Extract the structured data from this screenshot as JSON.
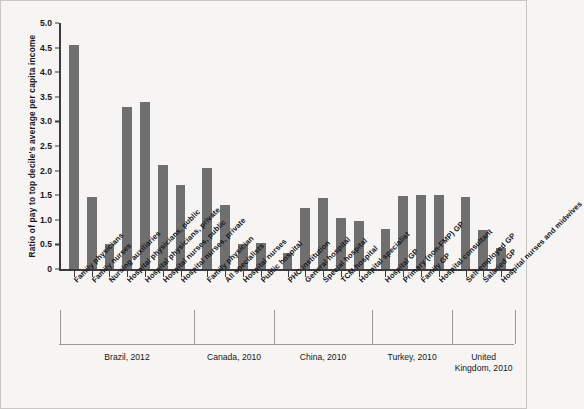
{
  "chart_data": {
    "type": "bar",
    "title": "",
    "xlabel": "",
    "ylabel": "Ratio of pay to top decile's average per capita income",
    "ylim": [
      0,
      5.0
    ],
    "ytick_labels": [
      "0",
      "0.5",
      "1.0",
      "1.5",
      "2.0",
      "2.5",
      "3.0",
      "3.5",
      "4.0",
      "4.5",
      "5.0"
    ],
    "ytick_values": [
      0,
      0.5,
      1.0,
      1.5,
      2.0,
      2.5,
      3.0,
      3.5,
      4.0,
      4.5,
      5.0
    ],
    "grid": false,
    "legend": "none",
    "bar_color": "#6f6f70",
    "background_color": "#f6f5f3",
    "categories": [
      "Family physicians",
      "Family nurses",
      "Nursing auxiliaries",
      "Hospital physicians, public",
      "Hospital physicians, private",
      "Hospital nurses, public",
      "Hospital nurses, private",
      "Family physician",
      "All specialists",
      "Hospital nurses",
      "Public hospital",
      "PHC institution",
      "General hospital",
      "Special hospital",
      "TCM hospital",
      "Hospital specialist",
      "Hospital GP",
      "Primary (non-FMP) GP",
      "Family GP",
      "Hospital consultant",
      "Self-employed GP",
      "Salaried GP",
      "Hospital nurses and midwives"
    ],
    "values": [
      4.55,
      1.47,
      0.5,
      3.3,
      3.4,
      2.12,
      1.7,
      2.05,
      1.31,
      0.5,
      0.53,
      0.32,
      1.25,
      1.45,
      1.04,
      0.97,
      0.82,
      1.49,
      1.5,
      1.5,
      1.46,
      0.8,
      0.43
    ],
    "groups": [
      {
        "label": "Brazil, 2012",
        "count": 7
      },
      {
        "label": "Canada, 2010",
        "count": 4
      },
      {
        "label": "China, 2010",
        "count": 5
      },
      {
        "label": "Turkey, 2010",
        "count": 4
      },
      {
        "label": "United Kingdom, 2010",
        "count": 3
      }
    ]
  }
}
